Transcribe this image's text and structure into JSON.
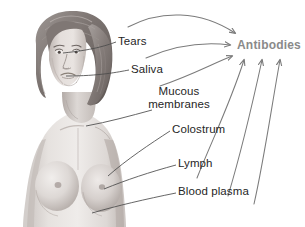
{
  "illustration": {
    "subject": "woman-torso-anatomical-illustration",
    "style": "grayscale-medical-drawing",
    "alt": "Grayscale illustration of a woman's head and upper torso"
  },
  "target": {
    "label": "Antibodies",
    "color": "#8a8a8a"
  },
  "colors": {
    "background": "#ffffff",
    "label_text": "#262626",
    "arrow": "#7b7b7b",
    "leader_line": "#4a4a4a",
    "skin_light": "#e8e4e1",
    "skin_mid": "#cfc9c6",
    "skin_shadow": "#a9a19d",
    "hair_light": "#b5aeab",
    "hair_dark": "#6e6663"
  },
  "sources": [
    {
      "id": "tears",
      "label": "Tears",
      "lines": [
        "Tears"
      ]
    },
    {
      "id": "saliva",
      "label": "Saliva",
      "lines": [
        "Saliva"
      ]
    },
    {
      "id": "mucous-membranes",
      "label": "Mucous membranes",
      "lines": [
        "Mucous",
        "membranes"
      ]
    },
    {
      "id": "colostrum",
      "label": "Colostrum",
      "lines": [
        "Colostrum"
      ]
    },
    {
      "id": "lymph",
      "label": "Lymph",
      "lines": [
        "Lymph"
      ]
    },
    {
      "id": "blood-plasma",
      "label": "Blood plasma",
      "lines": [
        "Blood plasma"
      ]
    }
  ],
  "arrow_count": 6
}
